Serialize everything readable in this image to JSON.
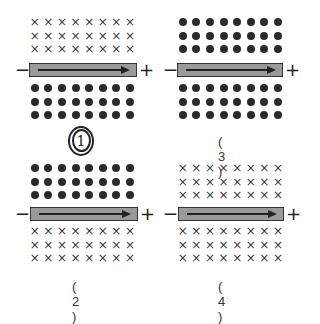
{
  "panels": [
    {
      "id": "1",
      "label": "1",
      "label_style": "circled-handwritten",
      "top_field": "cross",
      "bottom_field": "dot",
      "bar": {
        "left_sign": "−",
        "right_sign": "+",
        "arrow_direction": "right"
      }
    },
    {
      "id": "2",
      "label": "( 2 )",
      "top_field": "dot",
      "bottom_field": "cross",
      "bar": {
        "left_sign": "−",
        "right_sign": "+",
        "arrow_direction": "right"
      }
    },
    {
      "id": "3",
      "label": "( 3 )",
      "top_field": "dot",
      "bottom_field": "dot",
      "bar": {
        "left_sign": "−",
        "right_sign": "+",
        "arrow_direction": "right"
      }
    },
    {
      "id": "4",
      "label": "( 4 )",
      "top_field": "cross",
      "bottom_field": "cross",
      "bar": {
        "left_sign": "−",
        "right_sign": "+",
        "arrow_direction": "right"
      }
    }
  ],
  "symbols": {
    "cross": "×",
    "dot": "●"
  },
  "grid": {
    "rows_per_field": 3,
    "cols": 8
  }
}
